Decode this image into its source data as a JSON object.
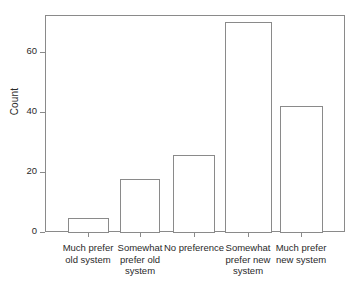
{
  "chart_data": {
    "type": "bar",
    "title": "",
    "xlabel": "",
    "ylabel": "Count",
    "categories": [
      "Much prefer old system",
      "Somewhat prefer old system",
      "No preference",
      "Somewhat prefer new system",
      "Much prefer new system"
    ],
    "category_lines": [
      [
        "Much prefer",
        "old system"
      ],
      [
        "Somewhat",
        "prefer old",
        "system"
      ],
      [
        "No preference"
      ],
      [
        "Somewhat",
        "prefer new",
        "system"
      ],
      [
        "Much prefer",
        "new system"
      ]
    ],
    "values": [
      5,
      18,
      26,
      70,
      42
    ],
    "ylim": [
      0,
      72
    ],
    "yticks": [
      0,
      20,
      40,
      60
    ],
    "ytick_labels": [
      "0",
      "20",
      "40",
      "60"
    ],
    "grid": false,
    "legend": null,
    "bar_fill": "#ffffff",
    "bar_edge_color": "#8a8a8a",
    "frame_color": "#8a8a8a",
    "background": "#ffffff",
    "text_color": "#2a2a2a"
  }
}
